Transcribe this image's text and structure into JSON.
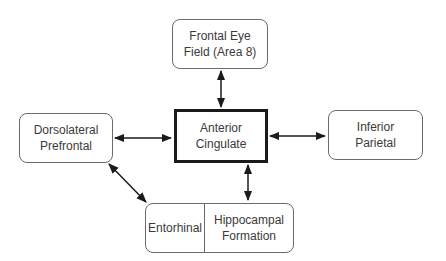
{
  "diagram": {
    "nodes": {
      "fef": {
        "label": "Frontal Eye\nField (Area 8)"
      },
      "acc": {
        "label": "Anterior\nCingulate"
      },
      "dlpfc": {
        "label": "Dorsolateral\nPrefrontal"
      },
      "ip": {
        "label": "Inferior\nParietal"
      },
      "entorhinal": {
        "label": "Entorhinal"
      },
      "hippocampal": {
        "label": "Hippocampal\nFormation"
      }
    },
    "edges": [
      {
        "from": "Frontal Eye Field (Area 8)",
        "to": "Anterior Cingulate",
        "type": "bidirectional"
      },
      {
        "from": "Dorsolateral Prefrontal",
        "to": "Anterior Cingulate",
        "type": "bidirectional"
      },
      {
        "from": "Anterior Cingulate",
        "to": "Inferior Parietal",
        "type": "bidirectional"
      },
      {
        "from": "Anterior Cingulate",
        "to": "Hippocampal Formation",
        "type": "bidirectional"
      },
      {
        "from": "Dorsolateral Prefrontal",
        "to": "Entorhinal",
        "type": "bidirectional"
      }
    ],
    "colors": {
      "line": "#1a1a1a",
      "box_border": "#6a6a6a",
      "text": "#3a3a3a"
    }
  }
}
